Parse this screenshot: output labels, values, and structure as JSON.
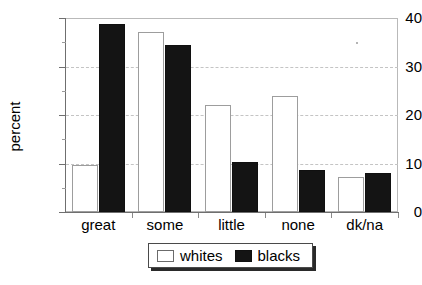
{
  "chart_data": {
    "type": "bar",
    "title": "",
    "xlabel": "",
    "ylabel": "percent",
    "categories": [
      "great",
      "some",
      "little",
      "none",
      "dk/na"
    ],
    "series": [
      {
        "name": "whites",
        "values": [
          9.7,
          37.2,
          22.0,
          24.0,
          7.2
        ],
        "fill": "#ffffff",
        "border": "#9d9d9d"
      },
      {
        "name": "blacks",
        "values": [
          38.7,
          34.5,
          10.3,
          8.7,
          8.1
        ],
        "fill": "#141414",
        "border": "#101010"
      }
    ],
    "ylim": [
      0,
      40
    ],
    "yticks": [
      0,
      10,
      20,
      30,
      40
    ],
    "yticks_minor": [
      5,
      15,
      25,
      35
    ],
    "gridlines": [
      10,
      20,
      30
    ],
    "grid": true,
    "grid_style": "dashed",
    "legend_position": "below-axes"
  },
  "axis": {
    "y_title": "percent",
    "y_tick_labels": [
      "0",
      "10",
      "20",
      "30",
      "40"
    ],
    "x_tick_labels": [
      "great",
      "some",
      "little",
      "none",
      "dk/na"
    ]
  },
  "legend": {
    "items": [
      {
        "label": "whites",
        "swatch": "white-square-icon"
      },
      {
        "label": "blacks",
        "swatch": "black-square-icon"
      }
    ]
  },
  "caption": {
    "text": ""
  }
}
